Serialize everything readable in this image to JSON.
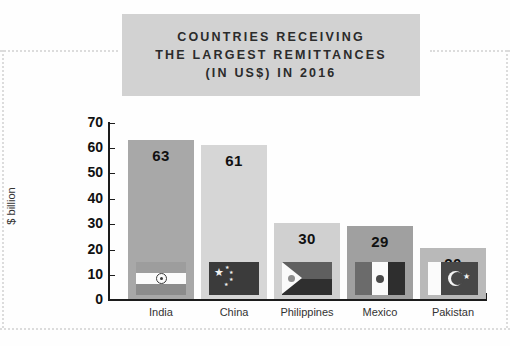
{
  "title": {
    "lines": [
      "COUNTRIES RECEIVING",
      "THE LARGEST REMITTANCES",
      "(IN US$) IN 2016"
    ],
    "background_color": "#d2d2d2",
    "text_color": "#2b2b2b"
  },
  "chart_data": {
    "type": "bar",
    "title": "COUNTRIES RECEIVING THE LARGEST REMITTANCES (IN US$) IN 2016",
    "xlabel": "",
    "ylabel": "$ billion",
    "categories": [
      "India",
      "China",
      "Philippines",
      "Mexico",
      "Pakistan"
    ],
    "values": [
      63,
      61,
      30,
      29,
      20
    ],
    "ylim": [
      0,
      70
    ],
    "yticks": [
      0,
      10,
      20,
      30,
      40,
      50,
      60,
      70
    ],
    "ytick_labels": [
      "0",
      "10",
      "20",
      "30",
      "40",
      "50",
      "60",
      "70"
    ],
    "grid": false,
    "legend": "none",
    "bar_colors": [
      "#a8a8a8",
      "#d6d6d6",
      "#d0d0d0",
      "#a0a0a0",
      "#b9b9b9"
    ],
    "value_label_color": "#111111",
    "axis_color": "#1c1c1c",
    "bars": [
      {
        "category": "India",
        "value": 63,
        "value_label": "63",
        "flag": "flag-india",
        "color": "#a8a8a8"
      },
      {
        "category": "China",
        "value": 61,
        "value_label": "61",
        "flag": "flag-china",
        "color": "#d6d6d6"
      },
      {
        "category": "Philippines",
        "value": 30,
        "value_label": "30",
        "flag": "flag-philippines",
        "color": "#d0d0d0"
      },
      {
        "category": "Mexico",
        "value": 29,
        "value_label": "29",
        "flag": "flag-mexico",
        "color": "#a0a0a0"
      },
      {
        "category": "Pakistan",
        "value": 20,
        "value_label": "20",
        "flag": "flag-pakistan",
        "color": "#b9b9b9"
      }
    ]
  },
  "decor": {
    "dotted_rule_color": "#dcdcdc"
  }
}
